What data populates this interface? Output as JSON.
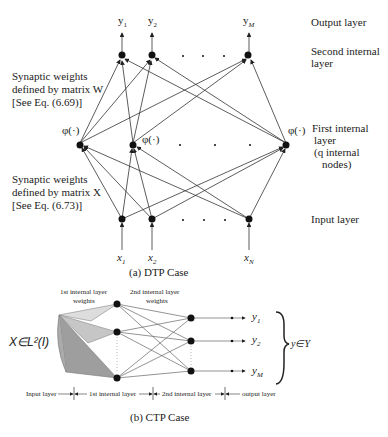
{
  "dtp": {
    "caption": "(a) DTP Case",
    "outputs": [
      "y1",
      "y2",
      "yM"
    ],
    "output_labels": [
      {
        "base": "y",
        "sub": "1"
      },
      {
        "base": "y",
        "sub": "2"
      },
      {
        "base": "y",
        "sub": "M"
      }
    ],
    "inputs": [
      {
        "base": "x",
        "sub": "1"
      },
      {
        "base": "x",
        "sub": "2"
      },
      {
        "base": "x",
        "sub": "N"
      }
    ],
    "phi": "φ(·)",
    "layer_labels": {
      "output": "Output layer",
      "second_internal": [
        "Second internal",
        "layer"
      ],
      "first_internal": [
        "First internal",
        "layer",
        "(q  internal",
        "nodes)"
      ],
      "input": "Input  layer"
    },
    "weights_w": [
      "Synaptic weights",
      "defined by matrix W",
      "[See Eq. (6.69)]"
    ],
    "weights_x": [
      "Synaptic weights",
      "defined by matrix X",
      "[See Eq. (6.73)]"
    ]
  },
  "ctp": {
    "caption": "(b) CTP Case",
    "input_label": "X∈L²(I)",
    "weights_1": [
      "1st internal layer",
      "weights"
    ],
    "weights_2": [
      "2nd internal layer",
      "weights"
    ],
    "outputs": [
      {
        "base": "y",
        "sub": "1"
      },
      {
        "base": "y",
        "sub": "2"
      },
      {
        "base": "y",
        "sub": "M"
      }
    ],
    "output_set": "y∈Y",
    "bottom_labels": [
      "Input layer",
      "1st internal layer",
      "2nd internal layer",
      "output layer"
    ]
  }
}
